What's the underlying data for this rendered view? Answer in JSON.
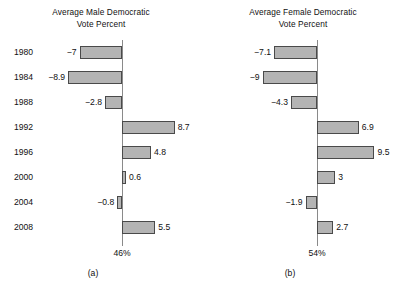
{
  "figure": {
    "width": 404,
    "height": 289,
    "background": "#ffffff",
    "bar_fill": "#b4b4b4",
    "bar_stroke": "#4a4a4a",
    "axis_color": "#8a8a8a"
  },
  "panels": [
    {
      "id": "a",
      "caption": "(a)",
      "title_line1": "Average Male Democratic",
      "title_line2": "Vote Percent",
      "baseline_label": "46%",
      "years": [
        "1980",
        "1984",
        "1988",
        "1992",
        "1996",
        "2000",
        "2004",
        "2008"
      ],
      "values": [
        -7,
        -8.9,
        -2.8,
        8.7,
        4.8,
        0.6,
        -0.8,
        5.5
      ],
      "value_labels": [
        "−7",
        "−8.9",
        "−2.8",
        "8.7",
        "4.8",
        "0.6",
        "−0.8",
        "5.5"
      ]
    },
    {
      "id": "b",
      "caption": "(b)",
      "title_line1": "Average Female Democratic",
      "title_line2": "Vote Percent",
      "baseline_label": "54%",
      "years": [
        "1980",
        "1984",
        "1988",
        "1992",
        "1996",
        "2000",
        "2004",
        "2008"
      ],
      "values": [
        -7.1,
        -9,
        -4.3,
        6.9,
        9.5,
        3,
        -1.9,
        2.7
      ],
      "value_labels": [
        "−7.1",
        "−9",
        "−4.3",
        "6.9",
        "9.5",
        "3",
        "−1.9",
        "2.7"
      ]
    }
  ],
  "chart_data": [
    {
      "type": "bar",
      "orientation": "horizontal",
      "title": "Average Male Democratic Vote Percent",
      "subtitle": "(a)",
      "xlabel": "",
      "ylabel": "",
      "categories": [
        "1980",
        "1984",
        "1988",
        "1992",
        "1996",
        "2000",
        "2004",
        "2008"
      ],
      "values": [
        -7,
        -8.9,
        -2.8,
        8.7,
        4.8,
        0.6,
        -0.8,
        5.5
      ],
      "baseline_tick_label": "46%",
      "baseline_value": 0,
      "xlim": [
        -10,
        10
      ],
      "grid": false,
      "legend": false,
      "data_labels": true
    },
    {
      "type": "bar",
      "orientation": "horizontal",
      "title": "Average Female Democratic Vote Percent",
      "subtitle": "(b)",
      "xlabel": "",
      "ylabel": "",
      "categories": [
        "1980",
        "1984",
        "1988",
        "1992",
        "1996",
        "2000",
        "2004",
        "2008"
      ],
      "values": [
        -7.1,
        -9,
        -4.3,
        6.9,
        9.5,
        3,
        -1.9,
        2.7
      ],
      "baseline_tick_label": "54%",
      "baseline_value": 0,
      "xlim": [
        -10,
        10
      ],
      "grid": false,
      "legend": false,
      "data_labels": true
    }
  ]
}
